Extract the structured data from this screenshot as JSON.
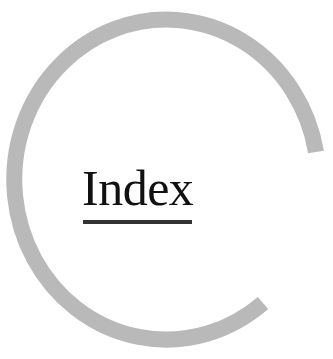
{
  "page": {
    "title": "Index",
    "decoration": {
      "type": "open-ring-arc",
      "color": "#b9b9b9",
      "underline_color": "#333333"
    }
  }
}
